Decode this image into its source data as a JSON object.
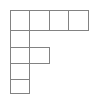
{
  "figure": {
    "kind": "polyomino-grid-diagram",
    "shape_name": "F-shape",
    "background_color": "#ffffff",
    "line_color": "#828282",
    "line_width": 1.1,
    "canvas": {
      "width": 96,
      "height": 97
    },
    "grid": {
      "columns": 4,
      "rows": 5,
      "x_lines": [
        10,
        29,
        49,
        68,
        88
      ],
      "y_lines": [
        10,
        30,
        47,
        63,
        79,
        93
      ],
      "cell_width_avg": 19.5,
      "cell_height_avg": 16.6
    },
    "filled_cells_by_row": [
      {
        "row": 1,
        "count": 4,
        "columns": [
          1,
          2,
          3,
          4
        ]
      },
      {
        "row": 2,
        "count": 1,
        "columns": [
          1
        ]
      },
      {
        "row": 3,
        "count": 2,
        "columns": [
          1,
          2
        ]
      },
      {
        "row": 4,
        "count": 1,
        "columns": [
          1
        ]
      },
      {
        "row": 5,
        "count": 1,
        "columns": [
          1
        ]
      }
    ],
    "total_cells": 9,
    "cells": [
      {
        "id": "r1c1",
        "row": 1,
        "col": 1,
        "x": 10,
        "y": 10,
        "w": 19,
        "h": 20
      },
      {
        "id": "r1c2",
        "row": 1,
        "col": 2,
        "x": 29,
        "y": 10,
        "w": 20,
        "h": 20
      },
      {
        "id": "r1c3",
        "row": 1,
        "col": 3,
        "x": 49,
        "y": 10,
        "w": 19,
        "h": 20
      },
      {
        "id": "r1c4",
        "row": 1,
        "col": 4,
        "x": 68,
        "y": 10,
        "w": 20,
        "h": 20
      },
      {
        "id": "r2c1",
        "row": 2,
        "col": 1,
        "x": 10,
        "y": 30,
        "w": 19,
        "h": 17
      },
      {
        "id": "r3c1",
        "row": 3,
        "col": 1,
        "x": 10,
        "y": 47,
        "w": 19,
        "h": 16
      },
      {
        "id": "r3c2",
        "row": 3,
        "col": 2,
        "x": 29,
        "y": 47,
        "w": 20,
        "h": 16
      },
      {
        "id": "r4c1",
        "row": 4,
        "col": 1,
        "x": 10,
        "y": 63,
        "w": 19,
        "h": 16
      },
      {
        "id": "r5c1",
        "row": 5,
        "col": 1,
        "x": 10,
        "y": 79,
        "w": 19,
        "h": 14
      }
    ]
  }
}
